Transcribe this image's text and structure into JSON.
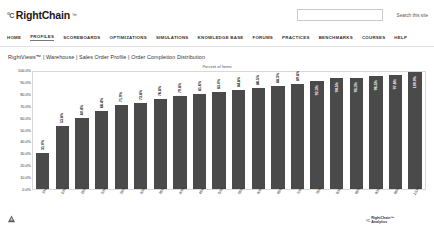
{
  "header": {
    "brand_mark": "°C",
    "brand_name": "RightChain",
    "brand_tm": "™"
  },
  "search": {
    "value": "",
    "placeholder": "",
    "button_label": "Search this site"
  },
  "nav": {
    "items": [
      {
        "label": "HOME",
        "active": false
      },
      {
        "label": "PROFILES",
        "active": true
      },
      {
        "label": "SCOREBOARDS",
        "active": false
      },
      {
        "label": "OPTIMIZATIONS",
        "active": false
      },
      {
        "label": "SIMULATIONS",
        "active": false
      },
      {
        "label": "KNOWLEDGE BASE",
        "active": false
      },
      {
        "label": "FORUMS",
        "active": false
      },
      {
        "label": "PRACTICES",
        "active": false
      },
      {
        "label": "BENCHMARKS",
        "active": false
      },
      {
        "label": "COURSES",
        "active": false
      },
      {
        "label": "HELP",
        "active": false
      }
    ]
  },
  "breadcrumb": {
    "text": "RightViews™ | Warehouse | Sales Order Profile | Order Completion Distribution"
  },
  "footer": {
    "logo_mark": "°C",
    "logo_line1": "RightChain™",
    "logo_line2": "Analytics"
  },
  "chart_data": {
    "type": "bar",
    "title": "Percent of Items",
    "xlabel": "",
    "ylabel": "Percent of Orders Completed",
    "ylim": [
      0,
      100
    ],
    "ytick_labels": [
      "100.0%",
      "90.0%",
      "80.0%",
      "70.0%",
      "60.0%",
      "50.0%",
      "40.0%",
      "30.0%",
      "20.0%",
      "10.0%",
      "0.0%"
    ],
    "grid": false,
    "legend": "none",
    "label_format": "percent",
    "inside_label_from_index": 14,
    "categories": [
      "5%",
      "10%",
      "15%",
      "20%",
      "25%",
      "30%",
      "35%",
      "40%",
      "45%",
      "50%",
      "55%",
      "60%",
      "65%",
      "70%",
      "75%",
      "80%",
      "85%",
      "90%",
      "95%",
      "100%"
    ],
    "values": [
      31.0,
      53.8,
      60.4,
      66.4,
      71.9,
      73.8,
      76.8,
      79.8,
      81.6,
      83.0,
      84.8,
      86.5,
      88.3,
      89.8,
      92.3,
      94.5,
      95.3,
      96.5,
      97.8,
      100.0
    ],
    "value_labels": [
      "31.0%",
      "53.8%",
      "60.4%",
      "66.4%",
      "71.9%",
      "73.8%",
      "76.8%",
      "79.8%",
      "81.6%",
      "83.0%",
      "84.8%",
      "86.5%",
      "88.3%",
      "89.8%",
      "92.3%",
      "94.5%",
      "95.3%",
      "96.5%",
      "97.8%",
      "100.0%"
    ],
    "bar_color": "#4a4a4a"
  }
}
